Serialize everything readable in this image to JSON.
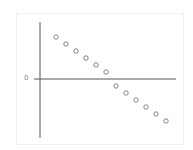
{
  "chart_data": {
    "type": "scatter",
    "title": "",
    "xlabel": "",
    "ylabel": "",
    "y_tick_labels": [
      "0"
    ],
    "x": [
      1,
      2,
      3,
      4,
      5,
      6,
      7,
      8,
      9,
      10,
      11,
      12
    ],
    "values": [
      6,
      5,
      4,
      3,
      2,
      1,
      -1,
      -2,
      -3,
      -4,
      -5,
      -6
    ],
    "grid": false,
    "legend": null,
    "marker": "open-circle",
    "colors": {
      "marker": "#777777",
      "axis": "#555555"
    }
  },
  "axis": {
    "zero_label": "0"
  }
}
